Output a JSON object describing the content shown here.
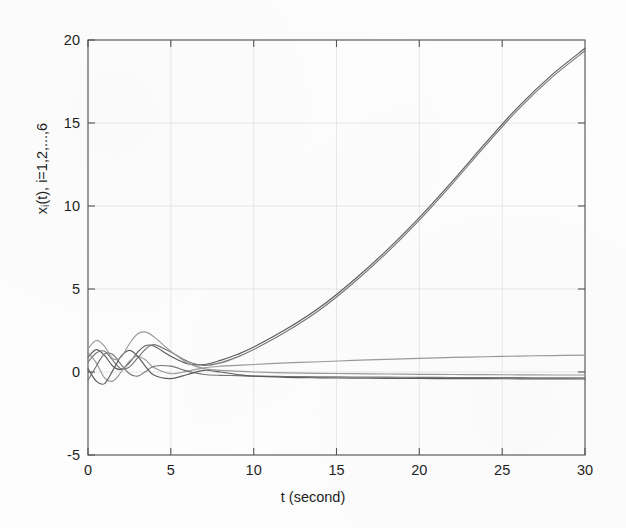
{
  "figure": {
    "background_color": "#fdfdfd",
    "axis_color": "#555555",
    "grid_color": "#cfcfcf",
    "curve_color": "#787878"
  },
  "axes": {
    "xlabel": "t (second)",
    "ylabel_prefix": "x",
    "ylabel_sub": "i",
    "ylabel_suffix": "(t), i=1,2,...,6",
    "xticks": [
      "0",
      "5",
      "10",
      "15",
      "20",
      "25",
      "30"
    ],
    "yticks": [
      "20",
      "15",
      "10",
      "5",
      "0",
      "-5"
    ]
  },
  "chart_data": {
    "type": "line",
    "title": "",
    "xlabel": "t (second)",
    "ylabel": "x_i(t), i=1,2,...,6",
    "xlim": [
      0,
      30
    ],
    "ylim": [
      -5,
      20
    ],
    "xticks": [
      0,
      5,
      10,
      15,
      20,
      25,
      30
    ],
    "yticks": [
      -5,
      0,
      5,
      10,
      15,
      20
    ],
    "grid": true,
    "legend": "none",
    "x": [
      0,
      0.5,
      1,
      1.5,
      2,
      2.5,
      3,
      3.5,
      4,
      5,
      6,
      7,
      8,
      9,
      10,
      12,
      14,
      16,
      18,
      20,
      22,
      24,
      26,
      28,
      30
    ],
    "series": [
      {
        "name": "x1",
        "description": "diverging state, exponential growth to ~19.5 at t=30",
        "values": [
          0.9,
          1.35,
          1.0,
          0.35,
          0.15,
          0.55,
          1.2,
          1.6,
          1.55,
          0.95,
          0.5,
          0.45,
          0.7,
          1.05,
          1.5,
          2.6,
          3.9,
          5.5,
          7.3,
          9.3,
          11.5,
          13.8,
          16.0,
          17.9,
          19.5
        ]
      },
      {
        "name": "x2",
        "description": "second diverging state, nearly overlapping x1",
        "values": [
          0.6,
          1.15,
          1.25,
          0.7,
          0.2,
          0.3,
          0.85,
          1.4,
          1.65,
          1.2,
          0.65,
          0.4,
          0.55,
          0.9,
          1.35,
          2.45,
          3.75,
          5.35,
          7.15,
          9.15,
          11.35,
          13.65,
          15.85,
          17.75,
          19.35
        ]
      },
      {
        "name": "x3",
        "description": "slowly rising state, settles to ~+1.0 at t=30",
        "values": [
          1.2,
          0.55,
          -0.35,
          -0.55,
          0.0,
          0.65,
          0.95,
          0.7,
          0.25,
          -0.1,
          0.05,
          0.25,
          0.35,
          0.4,
          0.45,
          0.55,
          0.62,
          0.7,
          0.76,
          0.82,
          0.88,
          0.92,
          0.96,
          0.99,
          1.02
        ]
      },
      {
        "name": "x4",
        "description": "damped oscillation settling slightly below zero (~-0.35)",
        "values": [
          -0.5,
          0.35,
          1.1,
          1.05,
          0.45,
          -0.1,
          -0.25,
          0.05,
          0.35,
          0.35,
          0.05,
          -0.15,
          -0.2,
          -0.22,
          -0.25,
          -0.27,
          -0.29,
          -0.3,
          -0.31,
          -0.32,
          -0.33,
          -0.34,
          -0.34,
          -0.35,
          -0.35
        ]
      },
      {
        "name": "x5",
        "description": "damped oscillation, larger early swing, settles near -0.4",
        "values": [
          0.2,
          -0.55,
          -0.7,
          0.1,
          0.95,
          1.3,
          0.95,
          0.3,
          -0.2,
          -0.4,
          -0.15,
          0.1,
          0.0,
          -0.15,
          -0.25,
          -0.32,
          -0.35,
          -0.37,
          -0.38,
          -0.39,
          -0.4,
          -0.4,
          -0.41,
          -0.41,
          -0.42
        ]
      },
      {
        "name": "x6",
        "description": "damped oscillation with largest peak ~2.4 near t=3.5, settles near 0",
        "values": [
          1.4,
          1.9,
          1.55,
          0.8,
          0.9,
          1.7,
          2.3,
          2.4,
          2.1,
          1.25,
          0.55,
          0.2,
          0.1,
          0.05,
          0.0,
          -0.05,
          -0.08,
          -0.1,
          -0.12,
          -0.14,
          -0.15,
          -0.16,
          -0.17,
          -0.18,
          -0.18
        ]
      }
    ]
  }
}
